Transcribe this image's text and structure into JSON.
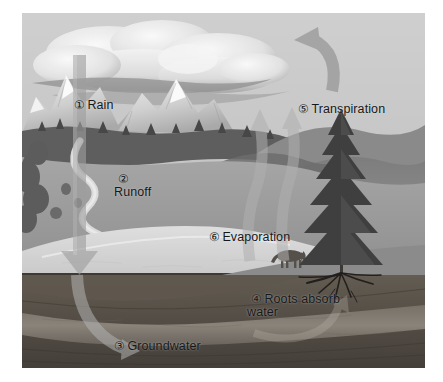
{
  "figure": {
    "style": "grayscale airbrush illustration",
    "frame": {
      "x": 22,
      "y": 13,
      "width": 403,
      "height": 355,
      "background": "#ffffff"
    }
  },
  "palette": {
    "sky": "#c9c9c9",
    "cloud_light": "#efefef",
    "cloud_shadow": "#9a9a9a",
    "snow_peak": "#e4e4e4",
    "mountain_far": "#b0b0b0",
    "mountain_mid": "#8d8d8d",
    "hill_dark": "#6f6f6f",
    "meadow": "#9e9e9e",
    "lake": "#d8d8d8",
    "river": "#dcdcdc",
    "soil_upper": "#5a544c",
    "soil_lower": "#4a453f",
    "aquifer": "#8a857c",
    "arrow_fill": "#9b9b9b",
    "tree_dark": "#3a3a3a",
    "text": "#16181a"
  },
  "labels": [
    {
      "id": "rain",
      "number": "①",
      "text": "Rain",
      "line2": "",
      "x": 38,
      "y": 72
    },
    {
      "id": "runoff",
      "number": "②",
      "text": "",
      "line2": "Runoff",
      "x": 82,
      "y": 146
    },
    {
      "id": "groundwater",
      "number": "③",
      "text": "Groundwater",
      "line2": "",
      "x": 78,
      "y": 313
    },
    {
      "id": "roots",
      "number": "④",
      "text": "Roots absorb",
      "line2": "water",
      "x": 215,
      "y": 266
    },
    {
      "id": "transpiration",
      "number": "⑤",
      "text": "Transpiration",
      "line2": "",
      "x": 262,
      "y": 76
    },
    {
      "id": "evaporation",
      "number": "⑥",
      "text": "Evaporation",
      "line2": "",
      "x": 173,
      "y": 204
    }
  ],
  "scene_elements": {
    "clouds": "cumulus cloud bank across upper sky",
    "mountains": "snow-capped peaks at left and center",
    "river": "winding river descending valley into lake",
    "lake": "pale lake filling mid-foreground",
    "conifer": "large spruce tree at right with exposed roots",
    "horse": "grazing horse on shoreline slope",
    "subsurface": "cutaway soil strata with groundwater aquifer band"
  },
  "arrows": {
    "rain": {
      "name": "rain-arrow",
      "direction": "down",
      "from": "cloud",
      "to": "ground"
    },
    "groundwater": {
      "name": "groundwater-arrow",
      "direction": "curve-down-right",
      "from": "ground surface",
      "to": "aquifer"
    },
    "evaporation": {
      "name": "evaporation-arrows",
      "count": 2,
      "direction": "up",
      "from": "lake",
      "to": "cloud"
    },
    "transpiration": {
      "name": "transpiration-arrow",
      "direction": "curve-up-left",
      "from": "tree canopy",
      "to": "cloud"
    },
    "roots": {
      "name": "root-uptake-arrow",
      "direction": "curve-up-right",
      "from": "aquifer",
      "to": "tree roots"
    }
  }
}
